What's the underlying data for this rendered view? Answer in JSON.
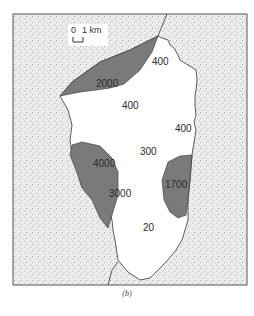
{
  "figure": {
    "caption": "(b)",
    "scale_bar": {
      "start": "0",
      "end": "1 km"
    },
    "colors": {
      "land_stipple": "#d6d6d6",
      "lake_high": "#7a7a7a",
      "lake_low": "#ffffff",
      "outline": "#333333"
    },
    "regions": [
      {
        "id": "region-2000",
        "value": "2000",
        "shade": "dark"
      },
      {
        "id": "region-400-ne",
        "value": "400",
        "shade": "light"
      },
      {
        "id": "region-400-center",
        "value": "400",
        "shade": "light"
      },
      {
        "id": "region-400-east",
        "value": "400",
        "shade": "light"
      },
      {
        "id": "region-300",
        "value": "300",
        "shade": "light"
      },
      {
        "id": "region-4000",
        "value": "4000",
        "shade": "dark"
      },
      {
        "id": "region-3000",
        "value": "3000",
        "shade": "dark"
      },
      {
        "id": "region-1700",
        "value": "1700",
        "shade": "dark"
      },
      {
        "id": "region-20",
        "value": "20",
        "shade": "light"
      }
    ]
  }
}
